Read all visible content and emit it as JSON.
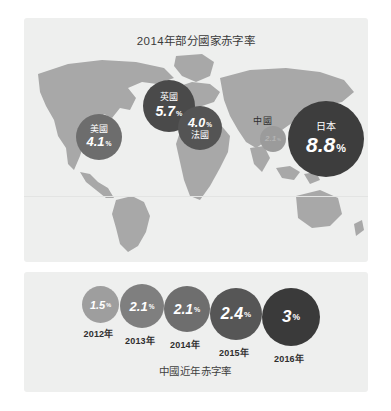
{
  "map_panel": {
    "title": "2014年部分國家赤字率",
    "background_color": "#eeefee",
    "land_color": "#a8a8a8"
  },
  "trend_panel": {
    "caption": "中國近年赤字率",
    "background_color": "#eeefee"
  },
  "chart_data": [
    {
      "type": "scatter",
      "title": "2014年部分國家赤字率",
      "xlabel": "",
      "ylabel": "",
      "note": "Bubble map: bubble area and darkness encode deficit ratio (%) per country, plotted over a world map.",
      "categories": [
        "美國",
        "英國",
        "法國",
        "中國",
        "日本"
      ],
      "values": [
        4.1,
        5.7,
        4.0,
        2.1,
        8.8
      ],
      "unit": "%",
      "points": [
        {
          "name": "美國",
          "value": "4.1",
          "unit": "%",
          "color": "#6d6d6d",
          "size_px": 46
        },
        {
          "name": "英國",
          "value": "5.7",
          "unit": "%",
          "color": "#4a4a4a",
          "size_px": 52
        },
        {
          "name": "法國",
          "value": "4.0",
          "unit": "%",
          "color": "#545454",
          "size_px": 44
        },
        {
          "name": "中國",
          "value": "2.1",
          "unit": "%",
          "color": "#9b9b9b",
          "size_px": 26
        },
        {
          "name": "日本",
          "value": "8.8",
          "unit": "%",
          "color": "#3d3d3d",
          "size_px": 76
        }
      ]
    },
    {
      "type": "bar",
      "title": "中國近年赤字率",
      "xlabel": "",
      "ylabel": "",
      "unit": "%",
      "note": "Bubble series: bubble diameter and darkness increase with the deficit ratio per year.",
      "categories": [
        "2012年",
        "2013年",
        "2014年",
        "2015年",
        "2016年"
      ],
      "values": [
        1.5,
        2.1,
        2.1,
        2.4,
        3
      ],
      "points": [
        {
          "label": "2012年",
          "value": "1.5",
          "unit": "%",
          "color": "#9e9e9e",
          "size_px": 37
        },
        {
          "label": "2013年",
          "value": "2.1",
          "unit": "%",
          "color": "#7f7f7f",
          "size_px": 44
        },
        {
          "label": "2014年",
          "value": "2.1",
          "unit": "%",
          "color": "#6e6e6e",
          "size_px": 46
        },
        {
          "label": "2015年",
          "value": "2.4",
          "unit": "%",
          "color": "#565656",
          "size_px": 52
        },
        {
          "label": "2016年",
          "value": "3",
          "unit": "%",
          "color": "#3a3a3a",
          "size_px": 58
        }
      ]
    }
  ]
}
